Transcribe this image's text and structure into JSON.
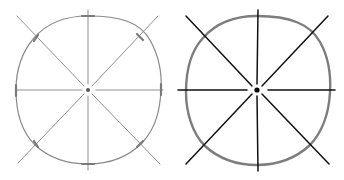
{
  "figure": {
    "panels": [
      {
        "id": "sketch-light",
        "description": "Light pencil sketch: circle with 8 radial guide lines and tick marks",
        "center": [
          88,
          90
        ],
        "radius": 73,
        "circle_color": "#8a8a8a",
        "line_color": "#8f8f8f",
        "stroke_width": 1.1
      },
      {
        "id": "sketch-bold",
        "description": "Inked version: bold gray circle with 8 black radial lines",
        "center": [
          257,
          90
        ],
        "radius": 73,
        "circle_color": "#7d7d7d",
        "line_color": "#111111",
        "stroke_width": 1.5
      }
    ]
  }
}
